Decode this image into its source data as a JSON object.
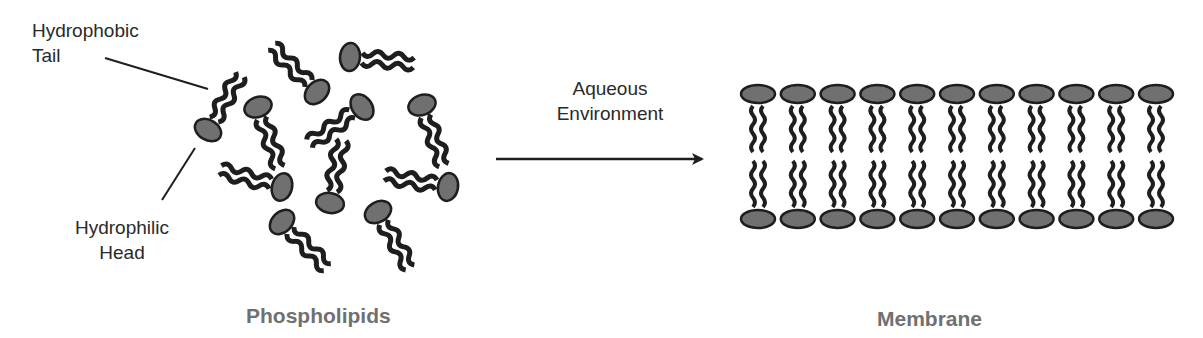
{
  "labels": {
    "tail_line1": "Hydrophobic",
    "tail_line2": "Tail",
    "head_line1": "Hydrophilic",
    "head_line2": "Head",
    "arrow_line1": "Aqueous",
    "arrow_line2": "Environment",
    "left_caption": "Phospholipids",
    "right_caption": "Membrane"
  },
  "colors": {
    "head_fill": "#707070",
    "outline": "#1e1e1e",
    "text": "#2a2a2a",
    "caption": "#707070"
  },
  "free_phospholipids": [
    {
      "hx": 208,
      "hy": 130,
      "angle": -60
    },
    {
      "hx": 258,
      "hy": 107,
      "angle": 70
    },
    {
      "hx": 317,
      "hy": 92,
      "angle": -135
    },
    {
      "hx": 350,
      "hy": 57,
      "angle": 5
    },
    {
      "hx": 362,
      "hy": 107,
      "angle": 145
    },
    {
      "hx": 422,
      "hy": 105,
      "angle": 70
    },
    {
      "hx": 282,
      "hy": 187,
      "angle": -165
    },
    {
      "hx": 330,
      "hy": 203,
      "angle": -80
    },
    {
      "hx": 448,
      "hy": 187,
      "angle": -170
    },
    {
      "hx": 282,
      "hy": 222,
      "angle": 45
    },
    {
      "hx": 378,
      "hy": 212,
      "angle": 60
    }
  ],
  "membrane": {
    "count": 11,
    "x_start": 758,
    "spacing": 39.8,
    "top_head_y": 94,
    "bottom_head_y": 219
  }
}
